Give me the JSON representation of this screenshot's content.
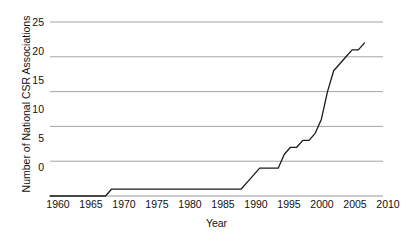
{
  "chart_data": {
    "type": "line",
    "title": "",
    "xlabel": "Year",
    "ylabel": "Number of National CSR Associations",
    "xlim": [
      1958,
      2012
    ],
    "ylim": [
      0,
      25
    ],
    "xticks": [
      1960,
      1965,
      1970,
      1975,
      1980,
      1985,
      1990,
      1995,
      2000,
      2005,
      2010
    ],
    "yticks": [
      0,
      5,
      10,
      15,
      20,
      25
    ],
    "grid": "horizontal",
    "legend": "none",
    "line_color": "#1a1a1a",
    "grid_color": "#9a9a9a",
    "series": [
      {
        "name": "Number of National CSR Associations",
        "x": [
          1958,
          1967,
          1968,
          1969,
          1989,
          1990,
          1991,
          1992,
          1995,
          1996,
          1997,
          1998,
          1999,
          2000,
          2001,
          2002,
          2003,
          2004,
          2005,
          2006,
          2007,
          2008,
          2009
        ],
        "values": [
          0,
          0,
          1,
          1,
          1,
          2,
          3,
          4,
          4,
          6,
          7,
          7,
          8,
          8,
          9,
          11,
          15,
          18,
          19,
          20,
          21,
          21,
          22
        ]
      }
    ]
  },
  "axis": {
    "y_title": "Number of National CSR Associations",
    "x_title": "Year",
    "ytick_labels": [
      "25",
      "20",
      "15",
      "10",
      "5",
      "0"
    ],
    "xtick_labels": [
      "1960",
      "1965",
      "1970",
      "1975",
      "1980",
      "1985",
      "1990",
      "1995",
      "2000",
      "2005",
      "2010"
    ]
  }
}
